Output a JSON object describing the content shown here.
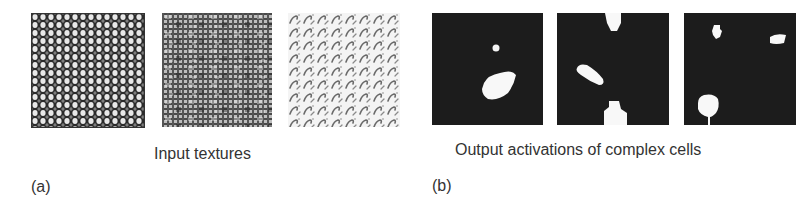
{
  "figure": {
    "panel_a": {
      "label": "(a)",
      "caption": "Input textures",
      "images": [
        {
          "name": "cellular-dot-texture",
          "description": "dark background with dense light blobs"
        },
        {
          "name": "grid-noise-texture",
          "description": "gray woven crosshatch grid noise"
        },
        {
          "name": "hook-pattern-texture",
          "description": "light background with repeated diagonal hook glyphs"
        }
      ]
    },
    "panel_b": {
      "label": "(b)",
      "caption": "Output activations of complex cells",
      "images": [
        {
          "name": "activation-map-1",
          "description": "small blob top-center, large blob lower-center"
        },
        {
          "name": "activation-map-2",
          "description": "blob top, diagonal blob left-middle, blob bottom"
        },
        {
          "name": "activation-map-3",
          "description": "small blob top-left, blob top-right, large blob bottom-left"
        }
      ]
    }
  }
}
